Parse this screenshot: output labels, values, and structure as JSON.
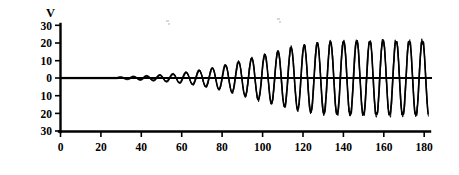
{
  "figure": {
    "name": "growing-oscillation-plot",
    "background_color": "#ffffff",
    "line_color": "#000000"
  },
  "chart_data": {
    "type": "line",
    "title": "",
    "subtitle": "",
    "xlabel": "",
    "ylabel": "V",
    "ylabel_position": "above-y-axis",
    "grid": false,
    "legend": null,
    "xlim": [
      0,
      184
    ],
    "ylim": [
      -30,
      30
    ],
    "x_ticks": [
      0,
      20,
      40,
      60,
      80,
      100,
      120,
      140,
      160,
      180
    ],
    "x_tick_labels": [
      "0",
      "20",
      "40",
      "60",
      "80",
      "100",
      "120",
      "140",
      "160",
      "180"
    ],
    "y_ticks": [
      30,
      20,
      10,
      0,
      -10,
      -20,
      -30
    ],
    "y_tick_labels": [
      "30",
      "20",
      "10",
      "0",
      "10",
      "20",
      "30"
    ],
    "series": [
      {
        "name": "V",
        "description": "self-excited growing oscillation saturating to a limit cycle",
        "period": 6.5,
        "onset_x": 28,
        "saturation_amplitude": 22,
        "growth_rate": 0.055,
        "waveform": "clipped-sine",
        "x_start": 0,
        "x_end": 182,
        "x": [
          0,
          10,
          20,
          28,
          35,
          45,
          55,
          65,
          75,
          85,
          95,
          105,
          115,
          125,
          135,
          145,
          155,
          165,
          175,
          182
        ],
        "envelope": [
          0,
          0,
          0,
          0.3,
          0.7,
          1.3,
          2.2,
          3.6,
          5.6,
          8.2,
          11.4,
          14.7,
          17.6,
          19.8,
          21.1,
          21.8,
          22.1,
          22.2,
          22.2,
          22.2
        ]
      }
    ]
  }
}
